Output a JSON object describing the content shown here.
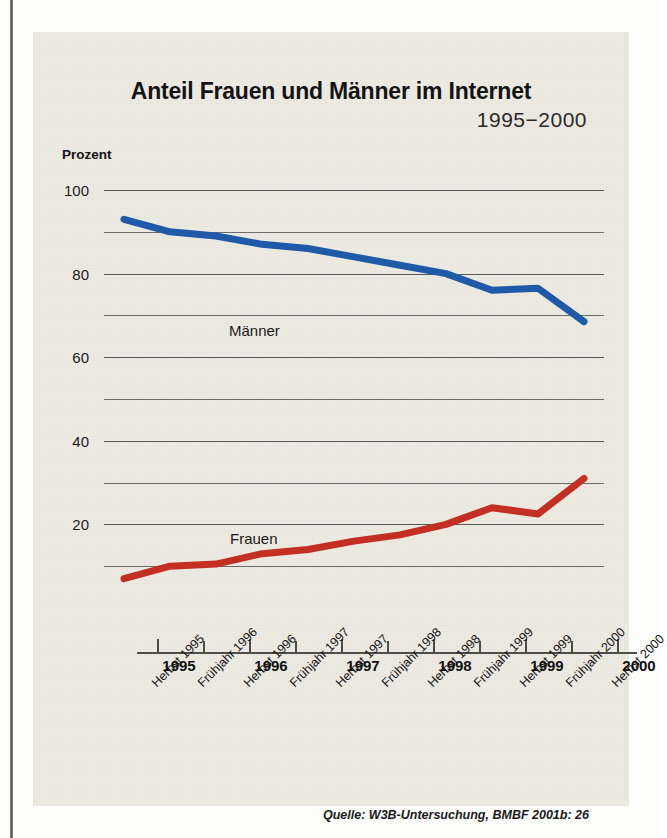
{
  "figure": {
    "title": "Anteil Frauen und Männer im Internet",
    "subtitle": "1995−2000",
    "y_axis_title": "Prozent",
    "source_note": "Quelle: W3B-Untersuchung, BMBF 2001b: 26"
  },
  "colors": {
    "maenner": "#1f5aa8",
    "frauen": "#c32f22",
    "grid": "#595954",
    "axis": "#4d4d48",
    "card_bg": "#edeae2",
    "text": "#141414"
  },
  "chart_data": {
    "type": "line",
    "title": "Anteil Frauen und Männer im Internet",
    "subtitle": "1995−2000",
    "xlabel": "",
    "ylabel": "Prozent",
    "ylim": [
      0,
      100
    ],
    "yticks": [
      20,
      40,
      60,
      80,
      100
    ],
    "ytick_labels": [
      "20",
      "40",
      "60",
      "80",
      "100"
    ],
    "minor_yticks": [
      10,
      30,
      50,
      70,
      90
    ],
    "grid": true,
    "legend": "inline-labels",
    "x": [
      "Herbst 1995",
      "Frühjahr 1996",
      "Herbst 1996",
      "Frühjahr 1997",
      "Herbst 1997",
      "Frühjahr 1998",
      "Herbst 1998",
      "Frühjahr 1999",
      "Herbst 1999",
      "Frühjahr 2000",
      "Herbst 2000"
    ],
    "year_axis": [
      "1995",
      "1996",
      "1997",
      "1998",
      "1999",
      "2000"
    ],
    "series": [
      {
        "name": "Männer",
        "color": "#1f5aa8",
        "values": [
          93,
          90,
          89,
          87,
          86,
          84,
          82,
          80,
          76,
          76.5,
          68.5
        ]
      },
      {
        "name": "Frauen",
        "color": "#c32f22",
        "values": [
          7,
          10,
          10.5,
          13,
          14,
          16,
          17.5,
          20,
          24,
          22.5,
          31
        ]
      }
    ]
  }
}
